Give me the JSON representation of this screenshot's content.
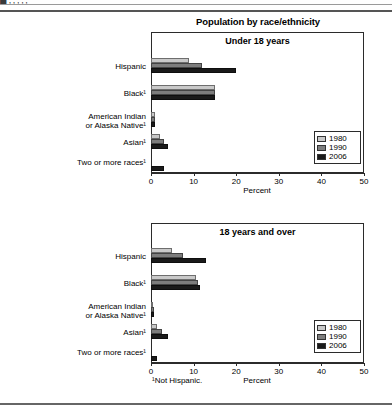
{
  "figure": {
    "title": "Population by race/ethnicity",
    "footnote": "¹Not Hispanic.",
    "axis_title": "Percent"
  },
  "legend": {
    "items": [
      {
        "label": "1980",
        "color": "#c9c9c9"
      },
      {
        "label": "1990",
        "color": "#7d7d7d"
      },
      {
        "label": "2006",
        "color": "#1a1a1a"
      }
    ]
  },
  "axis": {
    "ticks": [
      "0",
      "10",
      "20",
      "30",
      "40",
      "50"
    ],
    "min": 0,
    "max": 50
  },
  "categories": [
    "Hispanic",
    "Black¹",
    "American Indian or Alaska Native¹",
    "Asian¹",
    "Two or more races¹"
  ],
  "category_lines": [
    [
      "Hispanic"
    ],
    [
      "Black¹"
    ],
    [
      "American Indian",
      "or Alaska Native¹"
    ],
    [
      "Asian¹"
    ],
    [
      "Two or more races¹"
    ]
  ],
  "panels": [
    {
      "title": "Under 18 years"
    },
    {
      "title": "18 years and over"
    }
  ],
  "chart_data": [
    {
      "type": "bar",
      "title": "Under 18 years",
      "orientation": "horizontal",
      "xlabel": "Percent",
      "ylabel": "",
      "xlim": [
        0,
        50
      ],
      "grid": false,
      "legend_position": "inside-right",
      "categories": [
        "Hispanic",
        "Black¹",
        "American Indian or Alaska Native¹",
        "Asian¹",
        "Two or more races¹"
      ],
      "series": [
        {
          "name": "1980",
          "values": [
            9,
            15,
            1,
            2,
            0
          ]
        },
        {
          "name": "1990",
          "values": [
            12,
            15,
            1,
            3,
            0
          ]
        },
        {
          "name": "2006",
          "values": [
            20,
            15,
            1,
            4,
            3
          ]
        }
      ]
    },
    {
      "type": "bar",
      "title": "18 years and over",
      "orientation": "horizontal",
      "xlabel": "Percent",
      "ylabel": "",
      "xlim": [
        0,
        50
      ],
      "grid": false,
      "legend_position": "inside-right",
      "categories": [
        "Hispanic",
        "Black¹",
        "American Indian or Alaska Native¹",
        "Asian¹",
        "Two or more races¹"
      ],
      "series": [
        {
          "name": "1980",
          "values": [
            5,
            10.5,
            0.5,
            1.5,
            0
          ]
        },
        {
          "name": "1990",
          "values": [
            7.5,
            11,
            0.6,
            2.5,
            0
          ]
        },
        {
          "name": "2006",
          "values": [
            13,
            11.5,
            0.7,
            4,
            1.3
          ]
        }
      ]
    }
  ],
  "clipped_header": {
    "partial_text": "█                    ’ ’  ’             ’             ’"
  }
}
